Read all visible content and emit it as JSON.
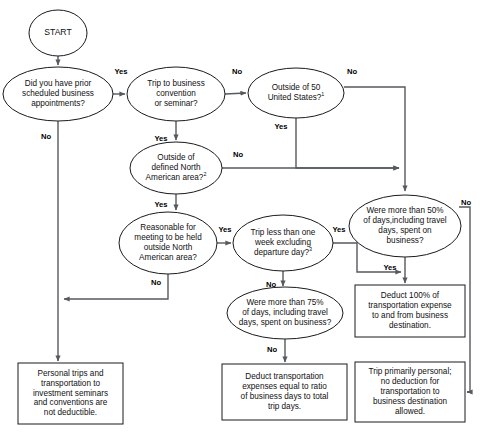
{
  "chart_data": {
    "type": "diagram",
    "diagram_kind": "flowchart",
    "nodes": [
      {
        "id": "start",
        "shape": "circle",
        "lines": [
          "START"
        ],
        "cx": 58,
        "cy": 33,
        "rx": 29,
        "ry": 23
      },
      {
        "id": "prior_appointments",
        "shape": "ellipse",
        "lines": [
          "Did you have prior",
          "scheduled business",
          "appointments?"
        ],
        "cx": 58,
        "cy": 94,
        "rx": 55,
        "ry": 27
      },
      {
        "id": "convention_seminar",
        "shape": "ellipse",
        "lines": [
          "Trip to business",
          "convention",
          "or seminar?"
        ],
        "cx": 176,
        "cy": 94,
        "rx": 49,
        "ry": 27
      },
      {
        "id": "outside_50_states",
        "shape": "ellipse",
        "lines": [
          "Outside of 50",
          "United States?"
        ],
        "superscript": "1",
        "cx": 296,
        "cy": 93,
        "rx": 48,
        "ry": 25
      },
      {
        "id": "outside_north_american_area",
        "shape": "ellipse",
        "lines": [
          "Outside of",
          "defined North",
          "American area?"
        ],
        "superscript": "2",
        "cx": 176,
        "cy": 168,
        "rx": 46,
        "ry": 26
      },
      {
        "id": "reasonable_meeting",
        "shape": "ellipse",
        "lines": [
          "Reasonable for",
          "meeting to be held",
          "outside North",
          "American area?"
        ],
        "cx": 168,
        "cy": 243,
        "rx": 49,
        "ry": 31
      },
      {
        "id": "trip_less_than_one_week",
        "shape": "ellipse",
        "lines": [
          "Trip less than one",
          "week excluding",
          "departure day?"
        ],
        "superscript": "3",
        "cx": 283,
        "cy": 243,
        "rx": 50,
        "ry": 28
      },
      {
        "id": "more_than_50_percent",
        "shape": "ellipse",
        "lines": [
          "Were more than 50%",
          "of days,including travel",
          "days, spent on",
          "business?"
        ],
        "cx": 405,
        "cy": 226,
        "rx": 56,
        "ry": 31
      },
      {
        "id": "more_than_75_percent",
        "shape": "ellipse",
        "lines": [
          "Were more than 75%",
          "of days, including travel",
          "days, spent on business?"
        ],
        "cx": 285,
        "cy": 313,
        "rx": 58,
        "ry": 26
      },
      {
        "id": "personal_trips_box",
        "shape": "rect",
        "lines": [
          "Personal trips and",
          "transportation to",
          "investment seminars",
          "and conventions are",
          "not deductible."
        ],
        "x": 18,
        "y": 363,
        "w": 105,
        "h": 61
      },
      {
        "id": "deduct_ratio_box",
        "shape": "rect",
        "lines": [
          "Deduct transportation",
          "expenses equal to ratio",
          "of business days to total",
          "trip days."
        ],
        "x": 222,
        "y": 364,
        "w": 125,
        "h": 56
      },
      {
        "id": "deduct_100_box",
        "shape": "rect",
        "lines": [
          "Deduct 100% of",
          "transportation expense",
          "to and from business",
          "destination."
        ],
        "x": 355,
        "y": 285,
        "w": 110,
        "h": 52
      },
      {
        "id": "trip_primarily_personal_box",
        "shape": "rect",
        "lines": [
          "Trip primarily personal;",
          "no deduction for",
          "transportation to",
          "business destination",
          "allowed."
        ],
        "x": 355,
        "y": 362,
        "w": 110,
        "h": 60
      }
    ],
    "edge_labels": [
      {
        "id": "prior_yes",
        "text": "Yes",
        "x": 121,
        "y": 72
      },
      {
        "id": "prior_no",
        "text": "No",
        "x": 46,
        "y": 137
      },
      {
        "id": "convention_no",
        "text": "No",
        "x": 237,
        "y": 72
      },
      {
        "id": "convention_yes",
        "text": "Yes",
        "x": 161,
        "y": 139
      },
      {
        "id": "outside50_no",
        "text": "No",
        "x": 352,
        "y": 72
      },
      {
        "id": "outside50_yes",
        "text": "Yes",
        "x": 281,
        "y": 127
      },
      {
        "id": "na_area_no",
        "text": "No",
        "x": 238,
        "y": 155
      },
      {
        "id": "na_area_yes",
        "text": "Yes",
        "x": 161,
        "y": 205
      },
      {
        "id": "reasonable_yes",
        "text": "Yes",
        "x": 225,
        "y": 230
      },
      {
        "id": "reasonable_no",
        "text": "No",
        "x": 156,
        "y": 283
      },
      {
        "id": "week_yes",
        "text": "Yes",
        "x": 339,
        "y": 230
      },
      {
        "id": "week_no",
        "text": "No",
        "x": 271,
        "y": 285
      },
      {
        "id": "fifty_no",
        "text": "No",
        "x": 466,
        "y": 203
      },
      {
        "id": "fifty_yes",
        "text": "Yes",
        "x": 390,
        "y": 268
      },
      {
        "id": "seventyfive_no",
        "text": "No",
        "x": 272,
        "y": 350
      }
    ],
    "colors": {
      "shape_stroke": "#1a1a1a",
      "shape_fill": "#ffffff",
      "connector": "#555a5e",
      "text": "#101010",
      "background": "#ffffff"
    }
  }
}
